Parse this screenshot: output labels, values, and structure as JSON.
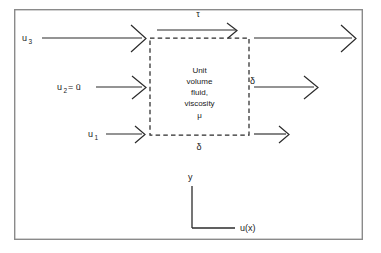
{
  "figure": {
    "type": "schematic",
    "background_color": "#ffffff",
    "line_color": "#2b2b2b",
    "frame_color": "#8a8a8a"
  },
  "frame": {
    "x": 14,
    "y": 9,
    "width": 349,
    "height": 231
  },
  "control_volume": {
    "name": "unit-volume-box",
    "style": "dashed",
    "x": 150,
    "y": 38,
    "width": 99,
    "height": 97,
    "text_lines": [
      "Unit",
      "volume",
      "fluid,",
      "viscosity"
    ],
    "symbol": "μ"
  },
  "shear": {
    "symbol": "τ",
    "label_x": 198,
    "label_y": 17,
    "arrow": {
      "x1": 157,
      "y1": 30,
      "x2": 236,
      "y2": 30
    }
  },
  "dimensions": {
    "height_label": "δ",
    "height_label_x": 252,
    "height_label_y": 81,
    "width_label": "δ",
    "width_label_x": 199,
    "width_label_y": 149
  },
  "inflow": [
    {
      "name": "u3",
      "base": "u",
      "subscript": "3",
      "label_x": 22,
      "label_y": 41,
      "line_x1": 42,
      "line_y1": 38,
      "line_x2": 142,
      "line_y2": 38,
      "arrow_size": 13
    },
    {
      "name": "u2",
      "base": "u",
      "subscript": "2",
      "suffix": " = ū",
      "label_x": 57,
      "label_y": 90,
      "line_x1": 96,
      "line_y1": 87,
      "line_x2": 142,
      "line_y2": 87,
      "arrow_size": 11
    },
    {
      "name": "u1",
      "base": "u",
      "subscript": "1",
      "label_x": 88,
      "label_y": 137,
      "line_x1": 106,
      "line_y1": 134,
      "line_x2": 142,
      "line_y2": 134,
      "arrow_size": 8
    }
  ],
  "outflow": [
    {
      "name": "outflow-top",
      "line_x1": 254,
      "line_y1": 38,
      "line_x2": 352,
      "line_y2": 38,
      "arrow_size": 13
    },
    {
      "name": "outflow-middle",
      "line_x1": 254,
      "line_y1": 87,
      "line_x2": 314,
      "line_y2": 87,
      "arrow_size": 11
    },
    {
      "name": "outflow-bottom",
      "line_x1": 254,
      "line_y1": 134,
      "line_x2": 286,
      "line_y2": 134,
      "arrow_size": 8
    }
  ],
  "axes": {
    "origin_x": 192,
    "origin_y": 228,
    "vertical_top": 186,
    "horizontal_right": 235,
    "y_label": "y",
    "y_label_x": 188,
    "y_label_y": 180,
    "x_label": "u(x)",
    "x_label_x": 240,
    "x_label_y": 231
  }
}
